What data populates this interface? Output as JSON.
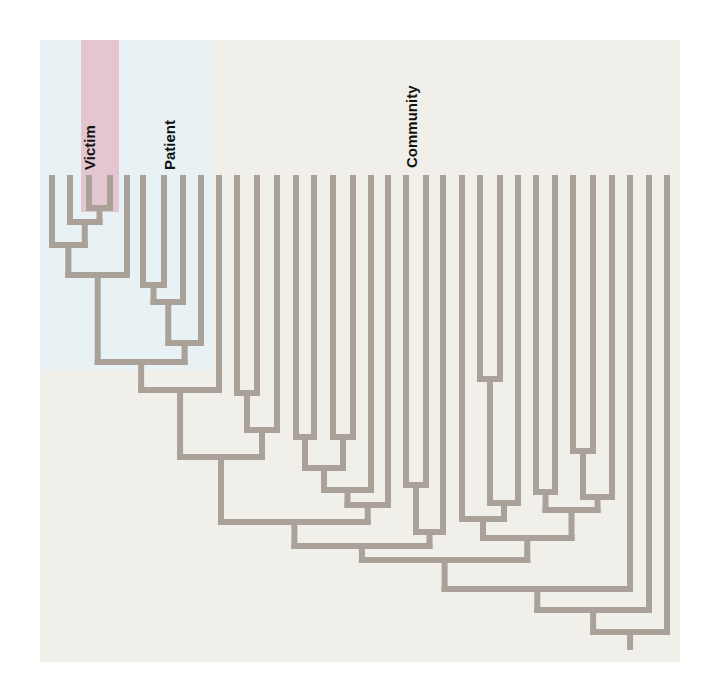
{
  "diagram": {
    "type": "dendrogram",
    "colors": {
      "page_background": "#ffffff",
      "panel_background": "#f0efe9",
      "patient_region": "#e8f1f4",
      "victim_region": "#e3c6cf",
      "branch": "#aaa198",
      "label_text": "#111111"
    },
    "panel": {
      "x": 40,
      "y": 40,
      "width": 640,
      "height": 622
    },
    "regions": [
      {
        "name": "patient-region",
        "x": 40,
        "y": 40,
        "width": 172,
        "height": 330,
        "color": "#e8f1f4"
      },
      {
        "name": "victim-region",
        "x": 81,
        "y": 40,
        "width": 38,
        "height": 172,
        "color": "#e3c6cf"
      }
    ],
    "labels": [
      {
        "name": "victim-label",
        "text": "Victim",
        "x": 90,
        "y": 170
      },
      {
        "name": "patient-label",
        "text": "Patient",
        "x": 170,
        "y": 170
      },
      {
        "name": "community-label",
        "text": "Community",
        "x": 412,
        "y": 168
      }
    ],
    "stroke_width": 6,
    "leaf_top_y": 178,
    "leaves_x": [
      52,
      70,
      89,
      110,
      127,
      143,
      164,
      183,
      201,
      219,
      237,
      257,
      277,
      296,
      314,
      333,
      353,
      371,
      388,
      406,
      426,
      443,
      462,
      480,
      500,
      518,
      536,
      555,
      573,
      593,
      612,
      630,
      649,
      667
    ],
    "joins": [
      {
        "a": 2,
        "b": 3,
        "y": 208
      },
      {
        "a": 1,
        "b": "n0",
        "y": 222
      },
      {
        "a": 0,
        "b": "n1",
        "y": 245
      },
      {
        "a": "n2",
        "b": 4,
        "y": 275
      },
      {
        "a": 5,
        "b": 6,
        "y": 285
      },
      {
        "a": "n4",
        "b": 7,
        "y": 302
      },
      {
        "a": "n5",
        "b": 8,
        "y": 343
      },
      {
        "a": "n3",
        "b": "n6",
        "y": 362
      },
      {
        "a": "n7",
        "b": 9,
        "y": 390
      },
      {
        "a": 10,
        "b": 11,
        "y": 393
      },
      {
        "a": "n9",
        "b": 12,
        "y": 430
      },
      {
        "a": "n8",
        "b": "n10",
        "y": 457
      },
      {
        "a": 13,
        "b": 14,
        "y": 437
      },
      {
        "a": 15,
        "b": 16,
        "y": 437
      },
      {
        "a": "n12",
        "b": "n13",
        "y": 468
      },
      {
        "a": "n14",
        "b": 17,
        "y": 490
      },
      {
        "a": "n15",
        "b": 18,
        "y": 505
      },
      {
        "a": "n11",
        "b": "n16",
        "y": 522
      },
      {
        "a": 19,
        "b": 20,
        "y": 485
      },
      {
        "a": "n18",
        "b": 21,
        "y": 532
      },
      {
        "a": "n17",
        "b": "n19",
        "y": 546
      },
      {
        "a": 23,
        "b": 24,
        "y": 379
      },
      {
        "a": "n21",
        "b": 25,
        "y": 503
      },
      {
        "a": 22,
        "b": "n22",
        "y": 519
      },
      {
        "a": 26,
        "b": 27,
        "y": 492
      },
      {
        "a": 28,
        "b": 29,
        "y": 451
      },
      {
        "a": "n25",
        "b": 30,
        "y": 497
      },
      {
        "a": "n24",
        "b": "n26",
        "y": 510
      },
      {
        "a": "n23",
        "b": "n27",
        "y": 538
      },
      {
        "a": "n20",
        "b": "n28",
        "y": 560
      },
      {
        "a": "n29",
        "b": 31,
        "y": 589
      },
      {
        "a": "n30",
        "b": 32,
        "y": 610
      },
      {
        "a": "n31",
        "b": 33,
        "y": 632
      }
    ],
    "root_stem_bottom_y": 647
  }
}
